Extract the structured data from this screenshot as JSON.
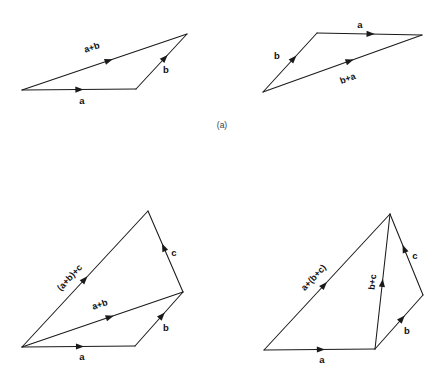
{
  "figure": {
    "background_color": "#ffffff",
    "stroke_color": "#1a1a1a",
    "label_color": "#111111",
    "caption_color": "#3c3c3c",
    "width": 445,
    "height": 372,
    "captions": [
      {
        "id": "caption-a",
        "text": "(a)",
        "x": 222,
        "y": 126
      }
    ],
    "panels": [
      {
        "id": "panel-top-left",
        "name": "triangle-a-plus-b",
        "vectors": [
          {
            "id": "vec-a-top-left",
            "label": "a",
            "x1": 22,
            "y1": 90,
            "x2": 136,
            "y2": 89,
            "arrow_t": 0.54,
            "label_x": 82,
            "label_y": 101,
            "label_rotate": 0,
            "label_anchor": "middle"
          },
          {
            "id": "vec-b-top-left",
            "label": "b",
            "x1": 136,
            "y1": 89,
            "x2": 187,
            "y2": 34,
            "arrow_t": 0.62,
            "label_x": 166,
            "label_y": 70,
            "label_rotate": 0,
            "label_anchor": "middle"
          },
          {
            "id": "vec-sum-ab-top-left",
            "label": "a+b",
            "x1": 22,
            "y1": 90,
            "x2": 187,
            "y2": 34,
            "arrow_t": 0.55,
            "label_x": 92,
            "label_y": 48,
            "label_rotate": -18.7,
            "label_anchor": "middle"
          }
        ]
      },
      {
        "id": "panel-top-right",
        "name": "triangle-b-plus-a",
        "vectors": [
          {
            "id": "vec-b-top-right",
            "label": "b",
            "x1": 263,
            "y1": 92,
            "x2": 317,
            "y2": 33,
            "arrow_t": 0.62,
            "label_x": 277,
            "label_y": 56,
            "label_rotate": 0,
            "label_anchor": "middle"
          },
          {
            "id": "vec-a-top-right",
            "label": "a",
            "x1": 317,
            "y1": 33,
            "x2": 422,
            "y2": 35,
            "arrow_t": 0.55,
            "label_x": 360,
            "label_y": 25,
            "label_rotate": 0,
            "label_anchor": "middle"
          },
          {
            "id": "vec-sum-ba-top-right",
            "label": "b+a",
            "x1": 263,
            "y1": 92,
            "x2": 422,
            "y2": 35,
            "arrow_t": 0.57,
            "label_x": 348,
            "label_y": 79,
            "label_rotate": -19.7,
            "label_anchor": "middle"
          }
        ]
      },
      {
        "id": "panel-bottom-left",
        "name": "quad-a-plus-b-plus-c",
        "vectors": [
          {
            "id": "vec-a-bottom-left",
            "label": "a",
            "x1": 22,
            "y1": 347,
            "x2": 135,
            "y2": 346,
            "arrow_t": 0.55,
            "label_x": 82,
            "label_y": 357,
            "label_rotate": 0,
            "label_anchor": "middle"
          },
          {
            "id": "vec-b-bottom-left",
            "label": "b",
            "x1": 135,
            "y1": 346,
            "x2": 183,
            "y2": 292,
            "arrow_t": 0.62,
            "label_x": 166,
            "label_y": 328,
            "label_rotate": 0,
            "label_anchor": "middle"
          },
          {
            "id": "vec-c-bottom-left",
            "label": "c",
            "x1": 183,
            "y1": 292,
            "x2": 148,
            "y2": 211,
            "arrow_t": 0.6,
            "label_x": 174,
            "label_y": 253,
            "label_rotate": 0,
            "label_anchor": "middle"
          },
          {
            "id": "vec-sum-ab-bottom-left",
            "label": "a+b",
            "x1": 22,
            "y1": 347,
            "x2": 183,
            "y2": 292,
            "arrow_t": 0.57,
            "label_x": 100,
            "label_y": 305,
            "label_rotate": -18.8,
            "label_anchor": "middle"
          },
          {
            "id": "vec-sum-abc-bottom-left",
            "label": "(a+b)+c",
            "x1": 22,
            "y1": 347,
            "x2": 148,
            "y2": 211,
            "arrow_t": 0.52,
            "label_x": 70,
            "label_y": 278,
            "label_rotate": -47.2,
            "label_anchor": "middle"
          }
        ]
      },
      {
        "id": "panel-bottom-right",
        "name": "quad-a-plus-bc",
        "vectors": [
          {
            "id": "vec-a-bottom-right",
            "label": "a",
            "x1": 264,
            "y1": 350,
            "x2": 375,
            "y2": 349,
            "arrow_t": 0.55,
            "label_x": 322,
            "label_y": 360,
            "label_rotate": 0,
            "label_anchor": "middle"
          },
          {
            "id": "vec-b-bottom-right",
            "label": "b",
            "x1": 375,
            "y1": 349,
            "x2": 423,
            "y2": 295,
            "arrow_t": 0.62,
            "label_x": 407,
            "label_y": 331,
            "label_rotate": 0,
            "label_anchor": "middle"
          },
          {
            "id": "vec-c-bottom-right",
            "label": "c",
            "x1": 423,
            "y1": 295,
            "x2": 390,
            "y2": 214,
            "arrow_t": 0.62,
            "label_x": 415,
            "label_y": 256,
            "label_rotate": 0,
            "label_anchor": "middle"
          },
          {
            "id": "vec-sum-bc-bottom-right",
            "label": "b+c",
            "x1": 375,
            "y1": 349,
            "x2": 390,
            "y2": 214,
            "arrow_t": 0.52,
            "label_x": 373,
            "label_y": 282,
            "label_rotate": -84,
            "label_anchor": "middle"
          },
          {
            "id": "vec-sum-abc-bottom-right",
            "label": "a+(b+c)",
            "x1": 264,
            "y1": 350,
            "x2": 390,
            "y2": 214,
            "arrow_t": 0.5,
            "label_x": 314,
            "label_y": 278,
            "label_rotate": -47.2,
            "label_anchor": "middle"
          }
        ]
      }
    ]
  }
}
